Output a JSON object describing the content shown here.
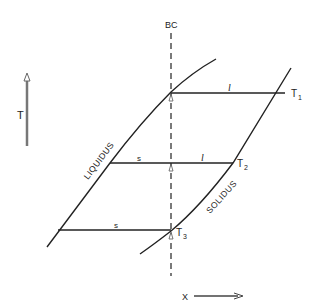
{
  "diagram": {
    "axes": {
      "y_label": "T",
      "x_label": "X"
    },
    "boundary_line_label": "BC",
    "curves": {
      "liquidus_label": "LIQUIDUS",
      "solidus_label": "SOLIDUS"
    },
    "tie_lines": [
      {
        "temperature_label": "T",
        "temperature_sub": "1",
        "left_phase": "",
        "right_phase": "l"
      },
      {
        "temperature_label": "T",
        "temperature_sub": "2",
        "left_phase": "s",
        "right_phase": "l"
      },
      {
        "temperature_label": "T",
        "temperature_sub": "3",
        "left_phase": "s",
        "right_phase": ""
      }
    ],
    "colors": {
      "ink": "#222222",
      "axis_arrow": "#555555",
      "background": "#ffffff"
    }
  }
}
